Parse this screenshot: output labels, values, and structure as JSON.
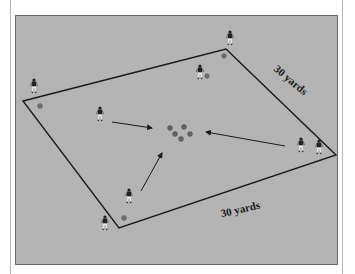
{
  "diagram": {
    "title": "",
    "field_labels": {
      "right_side": "30 yards",
      "bottom_side": "30 yards"
    },
    "colors": {
      "field": "#b4b4b4",
      "lines": "#1a1a1a",
      "cones": "#707070",
      "player": "#222222"
    },
    "cone_cluster_count": 5,
    "corner_cone_count": 4,
    "player_count": 9,
    "arrow_count": 3
  }
}
